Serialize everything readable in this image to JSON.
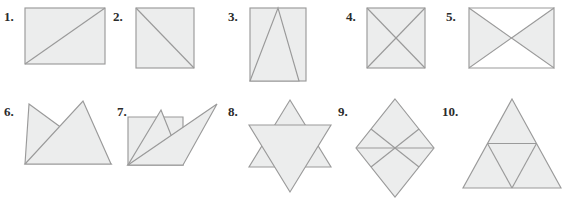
{
  "worksheet": {
    "background_color": "#ffffff",
    "shape_fill_color": "#eceded",
    "shape_stroke_color": "#9a9a9a",
    "label_color": "#2b2b2b"
  },
  "figures": [
    {
      "number": "1.",
      "label": "1.",
      "description": "rectangle with one diagonal from bottom-left to top-right",
      "shape_name": "rectangle-with-diagonal"
    },
    {
      "number": "2.",
      "label": "2.",
      "description": "square with one diagonal from top-left to bottom-right",
      "shape_name": "square-with-diagonal"
    },
    {
      "number": "3.",
      "label": "3.",
      "description": "rectangle with inscribed triangle from bottom corners to top center",
      "shape_name": "rectangle-with-inscribed-triangle"
    },
    {
      "number": "4.",
      "label": "4.",
      "description": "square with both diagonals forming an X",
      "shape_name": "square-with-both-diagonals"
    },
    {
      "number": "5.",
      "label": "5.",
      "description": "bowtie of two triangles meeting at a central point",
      "shape_name": "bowtie-two-triangles"
    },
    {
      "number": "6.",
      "label": "6.",
      "description": "two overlapping triangles on a shared baseline forming a crown",
      "shape_name": "two-overlapping-triangles-crown"
    },
    {
      "number": "7.",
      "label": "7.",
      "description": "quadrilateral with multiple crossing triangles",
      "shape_name": "quadrilateral-with-crossing-triangles"
    },
    {
      "number": "8.",
      "label": "8.",
      "description": "six-pointed star formed by two overlapping triangles",
      "shape_name": "hexagram-star"
    },
    {
      "number": "9.",
      "label": "9.",
      "description": "tall rhombus divided into six triangles radiating from the center",
      "shape_name": "rhombus-divided-into-six-triangles"
    },
    {
      "number": "10.",
      "label": "10.",
      "description": "large triangle subdivided into four smaller triangles",
      "shape_name": "triangle-subdivided-into-four"
    }
  ]
}
